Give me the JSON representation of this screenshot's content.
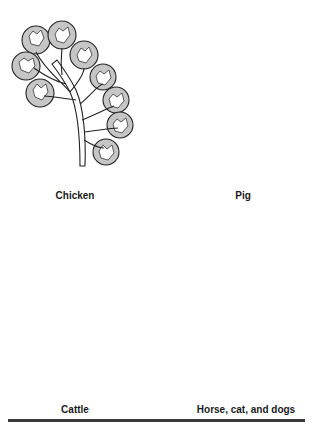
{
  "figure": {
    "panels": [
      {
        "id": "chicken",
        "label": "Chicken",
        "lobe_count": 8
      },
      {
        "id": "pig",
        "label": "Pig",
        "lobe_count": 5
      },
      {
        "id": "cattle",
        "label": "Cattle",
        "lobe_count": 10
      },
      {
        "id": "horse",
        "label": "Horse, cat, and dogs",
        "lobe_count": 1
      }
    ],
    "colors": {
      "cortex": "#c6c6c6",
      "outline": "#222222",
      "medulla": "#ffffff",
      "rule": "#3a3a3a"
    }
  }
}
